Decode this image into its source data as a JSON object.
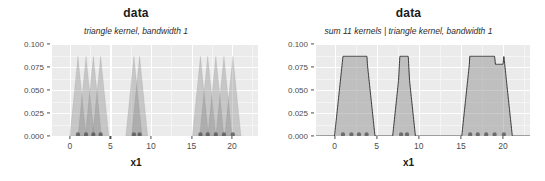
{
  "panels": [
    {
      "id": "left",
      "title": "data",
      "subtitle": "triangle kernel, bandwidth 1",
      "xlabel": "x1"
    },
    {
      "id": "right",
      "title": "data",
      "subtitle": "sum 11 kernels | triangle kernel, bandwidth 1",
      "xlabel": "x1"
    }
  ],
  "axis": {
    "y_ticks": [
      "0.100",
      "0.075",
      "0.050",
      "0.025",
      "0.000"
    ],
    "x_ticks": [
      "0",
      "5",
      "10",
      "15",
      "20"
    ]
  },
  "colors": {
    "panel_background": "#ebebeb",
    "gridline_major": "#ffffff",
    "gridline_minor": "#f5f5f5",
    "kernel_fill": "#7f7f7f",
    "outline": "#262626",
    "point": "#555555",
    "text": "#1a1a1a",
    "tick_text": "#4d4d4d"
  },
  "chart_data": {
    "type": "area",
    "title": "data",
    "xlabel": "x1",
    "ylabel": "",
    "xlim": [
      -2.2,
      23.2
    ],
    "ylim": [
      0.0,
      0.105
    ],
    "x_ticks": [
      0,
      5,
      10,
      15,
      20
    ],
    "y_ticks": [
      0.0,
      0.025,
      0.05,
      0.075,
      0.1
    ],
    "grid": true,
    "legend": "none",
    "kernel": "triangle",
    "bandwidth": 1,
    "n_kernels": 11,
    "data_points": [
      1.0,
      2.0,
      2.9,
      3.8,
      7.9,
      8.6,
      16.1,
      17.0,
      18.0,
      19.0,
      20.1
    ],
    "kernel_peak_height": 0.0909,
    "series": [
      {
        "name": "individual triangle kernels",
        "panel": "left",
        "subtitle": "triangle kernel, bandwidth 1",
        "description": "11 overlapping triangle kernels, each peak 0.0909, half-width 1",
        "peaks": [
          {
            "x": 1.0,
            "y": 0.0909
          },
          {
            "x": 2.0,
            "y": 0.0909
          },
          {
            "x": 2.9,
            "y": 0.0909
          },
          {
            "x": 3.8,
            "y": 0.0909
          },
          {
            "x": 7.9,
            "y": 0.0909
          },
          {
            "x": 8.6,
            "y": 0.0909
          },
          {
            "x": 16.1,
            "y": 0.0909
          },
          {
            "x": 17.0,
            "y": 0.0909
          },
          {
            "x": 18.0,
            "y": 0.0909
          },
          {
            "x": 19.0,
            "y": 0.0909
          },
          {
            "x": 20.1,
            "y": 0.0909
          }
        ]
      },
      {
        "name": "sum of 11 kernels",
        "panel": "right",
        "subtitle": "sum 11 kernels | triangle kernel, bandwidth 1",
        "description": "Sum of the 11 triangle kernels, forming three trapezoid clusters",
        "clusters": [
          {
            "x_start": 0.0,
            "x_plateau_start": 2.0,
            "x_plateau_end": 3.0,
            "x_end": 4.8,
            "y_plateau": 0.0909
          },
          {
            "x_start": 6.9,
            "x_plateau_start": 8.2,
            "x_plateau_end": 8.6,
            "x_end": 9.9,
            "y_plateau": 0.0909
          },
          {
            "x_start": 15.1,
            "x_plateau_start": 17.0,
            "x_plateau_end": 19.2,
            "x_end": 21.1,
            "y_plateau": 0.0909
          }
        ]
      }
    ]
  }
}
